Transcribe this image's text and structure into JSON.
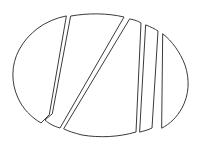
{
  "figure": {
    "background_color": "#ffffff",
    "stroke_color": "#3a3a3a",
    "fill_color": "#ffffff",
    "stroke_width": 1,
    "canvas": {
      "width": 200,
      "height": 148,
      "viewbox": "0 0 200 148"
    },
    "ellipse": {
      "center_x": 101,
      "center_y": 75,
      "radius_x": 87,
      "radius_y": 63,
      "left_extreme_x": 14,
      "right_extreme_x": 188,
      "top_extreme_y": 12,
      "bottom_extreme_y": 138
    },
    "piece_count": 5,
    "pieces": [
      {
        "name": "left-crescent",
        "label": "Left crescent piece",
        "path": "M 66 16 C 45 20 28 33 19 50 C 11 65 11 83 18 98 C 23 109 31 117 41 123 L 49 115 Z"
      },
      {
        "name": "second-slice",
        "label": "Second slice, tall wedge",
        "path": "M 71 16 C 88 13 107 13 124 17 L 60 128 C 53 126 48 123 45 120 L 52 114 Z"
      },
      {
        "name": "center-wedge",
        "label": "Large central wedge",
        "path": "M 130 19 C 135 20 138 21 141 23 L 136 132 C 119 137 100 138 82 135 C 74 133 68 131 64 129 Z"
      },
      {
        "name": "fourth-slice",
        "label": "Fourth narrow slice",
        "path": "M 146 25 C 151 27 155 29 158 31 L 152 128 C 148 130 144 131 140 132 Z"
      },
      {
        "name": "right-lens",
        "label": "Right lens-shaped piece",
        "path": "M 163 34 C 172 41 180 52 185 65 C 190 80 189 95 182 108 C 177 117 170 124 162 128 Z"
      }
    ]
  }
}
